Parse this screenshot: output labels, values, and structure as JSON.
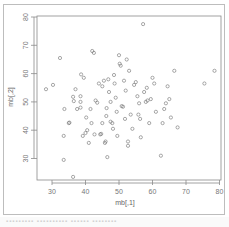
{
  "chart_data": {
    "type": "scatter",
    "title": "",
    "xlabel": "mb[,1]",
    "ylabel": "mb[,2]",
    "xlim": [
      26,
      80
    ],
    "ylim": [
      22,
      81
    ],
    "xticks": [
      30,
      40,
      50,
      60,
      70,
      80
    ],
    "yticks": [
      30,
      40,
      50,
      60,
      70,
      80
    ],
    "grid": false,
    "legend": null,
    "marker": "open-circle",
    "points": [
      {
        "x": 28.2,
        "y": 54.5
      },
      {
        "x": 30.3,
        "y": 56.0
      },
      {
        "x": 32.4,
        "y": 65.5
      },
      {
        "x": 33.7,
        "y": 47.5
      },
      {
        "x": 33.5,
        "y": 38.0
      },
      {
        "x": 33.5,
        "y": 29.5
      },
      {
        "x": 35.0,
        "y": 42.5
      },
      {
        "x": 35.2,
        "y": 42.7
      },
      {
        "x": 36.3,
        "y": 51.8
      },
      {
        "x": 36.5,
        "y": 50.3
      },
      {
        "x": 36.3,
        "y": 23.5
      },
      {
        "x": 37.0,
        "y": 54.5
      },
      {
        "x": 37.5,
        "y": 47.5
      },
      {
        "x": 38.5,
        "y": 52.0
      },
      {
        "x": 38.5,
        "y": 50.0
      },
      {
        "x": 38.5,
        "y": 48.0
      },
      {
        "x": 38.7,
        "y": 59.7
      },
      {
        "x": 39.2,
        "y": 38.0
      },
      {
        "x": 39.5,
        "y": 58.5
      },
      {
        "x": 40.0,
        "y": 39.0
      },
      {
        "x": 40.2,
        "y": 44.5
      },
      {
        "x": 40.5,
        "y": 40.0
      },
      {
        "x": 41.0,
        "y": 35.5
      },
      {
        "x": 41.5,
        "y": 47.5
      },
      {
        "x": 41.8,
        "y": 42.5
      },
      {
        "x": 42.0,
        "y": 68.0
      },
      {
        "x": 42.5,
        "y": 67.3
      },
      {
        "x": 42.7,
        "y": 38.5
      },
      {
        "x": 43.0,
        "y": 50.5
      },
      {
        "x": 43.5,
        "y": 49.7
      },
      {
        "x": 44.0,
        "y": 56.5
      },
      {
        "x": 44.4,
        "y": 38.5
      },
      {
        "x": 44.7,
        "y": 38.7
      },
      {
        "x": 45.0,
        "y": 55.5
      },
      {
        "x": 45.0,
        "y": 42.5
      },
      {
        "x": 45.5,
        "y": 57.5
      },
      {
        "x": 45.8,
        "y": 35.5
      },
      {
        "x": 46.0,
        "y": 36.0
      },
      {
        "x": 46.2,
        "y": 45.0
      },
      {
        "x": 46.3,
        "y": 47.8
      },
      {
        "x": 46.5,
        "y": 30.5
      },
      {
        "x": 46.8,
        "y": 58.0
      },
      {
        "x": 47.0,
        "y": 53.5
      },
      {
        "x": 47.5,
        "y": 50.0
      },
      {
        "x": 47.5,
        "y": 43.0
      },
      {
        "x": 48.0,
        "y": 42.5
      },
      {
        "x": 48.2,
        "y": 40.5
      },
      {
        "x": 48.5,
        "y": 59.5
      },
      {
        "x": 48.7,
        "y": 56.5
      },
      {
        "x": 49.0,
        "y": 51.5
      },
      {
        "x": 49.3,
        "y": 46.5
      },
      {
        "x": 49.5,
        "y": 38.0
      },
      {
        "x": 50.0,
        "y": 66.5
      },
      {
        "x": 50.2,
        "y": 63.5
      },
      {
        "x": 50.5,
        "y": 62.8
      },
      {
        "x": 50.8,
        "y": 48.5
      },
      {
        "x": 51.2,
        "y": 48.3
      },
      {
        "x": 51.5,
        "y": 57.5
      },
      {
        "x": 51.8,
        "y": 44.0
      },
      {
        "x": 52.0,
        "y": 54.0
      },
      {
        "x": 52.3,
        "y": 65.0
      },
      {
        "x": 52.7,
        "y": 36.0
      },
      {
        "x": 52.7,
        "y": 34.5
      },
      {
        "x": 53.0,
        "y": 61.0
      },
      {
        "x": 53.5,
        "y": 45.5
      },
      {
        "x": 54.0,
        "y": 40.5
      },
      {
        "x": 54.5,
        "y": 56.0
      },
      {
        "x": 55.0,
        "y": 57.0
      },
      {
        "x": 55.5,
        "y": 52.0
      },
      {
        "x": 55.8,
        "y": 45.5
      },
      {
        "x": 56.0,
        "y": 49.5
      },
      {
        "x": 56.3,
        "y": 44.0
      },
      {
        "x": 56.5,
        "y": 37.5
      },
      {
        "x": 57.2,
        "y": 77.5
      },
      {
        "x": 57.5,
        "y": 53.5
      },
      {
        "x": 58.0,
        "y": 50.0
      },
      {
        "x": 58.3,
        "y": 55.0
      },
      {
        "x": 58.5,
        "y": 50.5
      },
      {
        "x": 59.0,
        "y": 42.5
      },
      {
        "x": 59.5,
        "y": 51.0
      },
      {
        "x": 60.0,
        "y": 58.5
      },
      {
        "x": 60.5,
        "y": 56.5
      },
      {
        "x": 61.0,
        "y": 46.5
      },
      {
        "x": 62.5,
        "y": 31.0
      },
      {
        "x": 63.0,
        "y": 42.5
      },
      {
        "x": 63.5,
        "y": 47.5
      },
      {
        "x": 64.0,
        "y": 49.5
      },
      {
        "x": 64.5,
        "y": 55.5
      },
      {
        "x": 65.0,
        "y": 51.0
      },
      {
        "x": 65.5,
        "y": 44.5
      },
      {
        "x": 66.5,
        "y": 61.0
      },
      {
        "x": 67.5,
        "y": 41.0
      },
      {
        "x": 75.5,
        "y": 56.5
      },
      {
        "x": 78.5,
        "y": 61.0
      }
    ]
  },
  "axes": {
    "x_title": "mb[,1]",
    "y_title": "mb[,2]",
    "x_ticks": [
      "30",
      "40",
      "50",
      "60",
      "70",
      "80"
    ],
    "y_ticks": [
      "30",
      "40",
      "50",
      "60",
      "70",
      "80"
    ]
  },
  "footer": {
    "text": "▪▪▪▪▪▪▪▪▪   ▪▪▪▪▪▪▪▪▪▪   ▪▪▪▪▪▪   ▪▪▪▪▪▪▪▪"
  }
}
